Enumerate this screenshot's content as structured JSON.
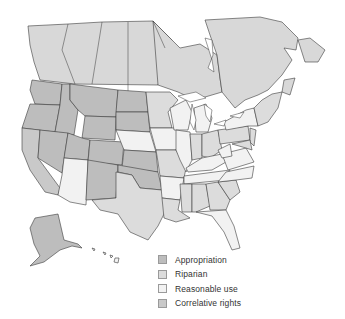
{
  "legend": {
    "items": [
      {
        "label": "Appropriation",
        "color": "#bdbdbd"
      },
      {
        "label": "Riparian",
        "color": "#dcdcdc"
      },
      {
        "label": "Reasonable use",
        "color": "#f2f2f2"
      },
      {
        "label": "Correlative rights",
        "color": "#c9c9c9"
      }
    ]
  },
  "colors": {
    "canada": "#d8d8d8",
    "appropriation": "#bdbdbd",
    "riparian": "#dcdcdc",
    "reasonable_use": "#f2f2f2",
    "correlative_rights": "#c9c9c9",
    "border": "#3a3a3a"
  }
}
